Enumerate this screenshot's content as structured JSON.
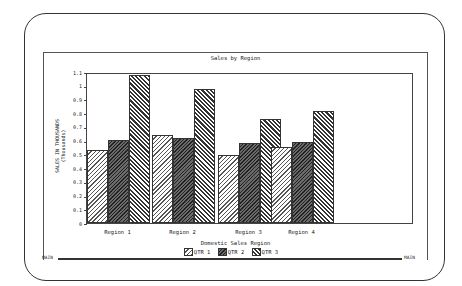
{
  "window": {
    "status_left": "MAIN",
    "status_right": "MAIN"
  },
  "chart": {
    "title": "Sales by Region",
    "ylabel_line1": "SALES IN THOUSANDS",
    "ylabel_line2": "(Thousands)",
    "xlabel": "Domestic Sales Region",
    "yticks": [
      "0",
      "0.1",
      "0.2",
      "0.3",
      "0.4",
      "0.5",
      "0.6",
      "0.7",
      "0.8",
      "0.9",
      "1",
      "1.1"
    ],
    "categories": [
      "Region 1",
      "Region 2",
      "Region 3",
      "Region 4"
    ],
    "legend": [
      "QTR 1",
      "QTR 2",
      "QTR 3"
    ]
  },
  "chart_data": {
    "type": "bar",
    "title": "Sales by Region",
    "xlabel": "Domestic Sales Region",
    "ylabel": "SALES IN THOUSANDS (Thousands)",
    "categories": [
      "Region 1",
      "Region 2",
      "Region 3",
      "Region 4"
    ],
    "series": [
      {
        "name": "QTR 1",
        "values": [
          0.54,
          0.65,
          0.5,
          0.56
        ]
      },
      {
        "name": "QTR 2",
        "values": [
          0.61,
          0.63,
          0.59,
          0.6
        ]
      },
      {
        "name": "QTR 3",
        "values": [
          1.09,
          0.99,
          0.77,
          0.83
        ]
      }
    ],
    "ylim": [
      0,
      1.1
    ],
    "yticks": [
      0,
      0.1,
      0.2,
      0.3,
      0.4,
      0.5,
      0.6,
      0.7,
      0.8,
      0.9,
      1.0,
      1.1
    ],
    "grid": false,
    "legend_position": "bottom"
  }
}
